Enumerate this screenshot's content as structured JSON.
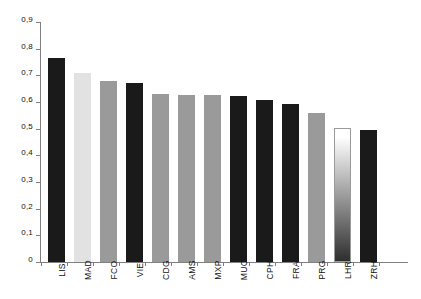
{
  "chart_data": {
    "type": "bar",
    "title": "",
    "subtitle": "",
    "xlabel": "",
    "ylabel": "",
    "ylim": [
      0,
      0.9
    ],
    "grid": false,
    "legend": "none",
    "decimal_separator": ",",
    "categories": [
      "LIS",
      "MAD",
      "FCO",
      "VIE",
      "CDG",
      "AMS",
      "MXP",
      "MUC",
      "CPH",
      "FRA",
      "PRG",
      "LHR",
      "ZRH"
    ],
    "values": [
      0.765,
      0.708,
      0.68,
      0.673,
      0.629,
      0.627,
      0.625,
      0.622,
      0.609,
      0.592,
      0.557,
      0.502,
      0.495
    ],
    "ytick_labels": [
      "0,9",
      "0,8",
      "0,7",
      "0,6",
      "0,5",
      "0,4",
      "0,3",
      "0,2",
      "0,1",
      "0"
    ],
    "ytick_values": [
      0.9,
      0.8,
      0.7,
      0.6,
      0.5,
      0.4,
      0.3,
      0.2,
      0.1,
      0
    ],
    "bar_styles": [
      {
        "category": "LIS",
        "fill": "solid",
        "color": "#1a1a1a"
      },
      {
        "category": "MAD",
        "fill": "solid",
        "color": "#e2e2e2"
      },
      {
        "category": "FCO",
        "fill": "solid",
        "color": "#9a9a9a"
      },
      {
        "category": "VIE",
        "fill": "solid",
        "color": "#1a1a1a"
      },
      {
        "category": "CDG",
        "fill": "solid",
        "color": "#9a9a9a"
      },
      {
        "category": "AMS",
        "fill": "solid",
        "color": "#9a9a9a"
      },
      {
        "category": "MXP",
        "fill": "solid",
        "color": "#9a9a9a"
      },
      {
        "category": "MUC",
        "fill": "solid",
        "color": "#1a1a1a"
      },
      {
        "category": "CPH",
        "fill": "solid",
        "color": "#1a1a1a"
      },
      {
        "category": "FRA",
        "fill": "solid",
        "color": "#1a1a1a"
      },
      {
        "category": "PRG",
        "fill": "solid",
        "color": "#9a9a9a"
      },
      {
        "category": "LHR",
        "fill": "gradient",
        "color": "#ffffff",
        "color2": "#2e2e2e"
      },
      {
        "category": "ZRH",
        "fill": "solid",
        "color": "#1a1a1a"
      }
    ],
    "axis_color": "#808080",
    "background": "#ffffff"
  }
}
